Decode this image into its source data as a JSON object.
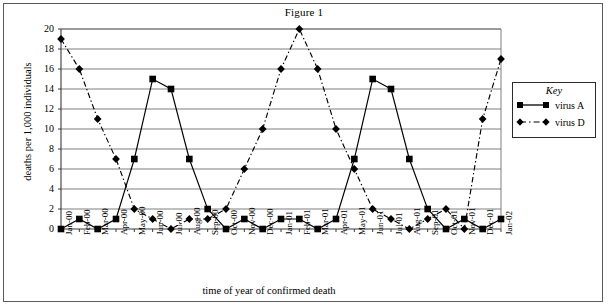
{
  "figure": {
    "title": "Figure 1"
  },
  "legend": {
    "title": "Key",
    "entries": [
      {
        "label": "virus A",
        "marker": "square",
        "line": "solid"
      },
      {
        "label": "virus D",
        "marker": "diamond",
        "line": "dash-dot"
      }
    ]
  },
  "chart_data": {
    "type": "line",
    "title": "Figure 1",
    "xlabel": "time of year of confirmed death",
    "ylabel": "deaths per 1,000 individuals",
    "ylim": [
      0,
      20
    ],
    "ytick_step": 2,
    "yticks": [
      "0",
      "2",
      "4",
      "6",
      "8",
      "10",
      "12",
      "14",
      "16",
      "18",
      "20"
    ],
    "grid": true,
    "legend_position": "right",
    "categories": [
      "Jan-00",
      "Feb-00",
      "Mar-00",
      "Apr-00",
      "May-00",
      "Jun-00",
      "Jul-00",
      "Aug-00",
      "Sep-00",
      "Oct-00",
      "Nov-00",
      "Dec-00",
      "Jan-01",
      "Feb-01",
      "Mar-01",
      "Apr-01",
      "May-01",
      "Jun-01",
      "Jul-01",
      "Aug-01",
      "Sep-01",
      "Oct-01",
      "Nov-01",
      "Dec-01",
      "Jan-02"
    ],
    "series": [
      {
        "name": "virus A",
        "marker": "square",
        "line": "solid",
        "color": "#000000",
        "values": [
          0,
          1,
          0,
          1,
          7,
          15,
          14,
          7,
          2,
          0,
          1,
          0,
          1,
          1,
          0,
          1,
          7,
          15,
          14,
          7,
          2,
          0,
          1,
          0,
          1
        ]
      },
      {
        "name": "virus D",
        "marker": "diamond",
        "line": "dash-dot",
        "color": "#000000",
        "values": [
          19,
          16,
          11,
          7,
          2,
          1,
          0,
          1,
          1,
          2,
          6,
          10,
          16,
          20,
          16,
          10,
          6,
          2,
          1,
          0,
          1,
          2,
          0,
          11,
          17
        ]
      }
    ]
  }
}
